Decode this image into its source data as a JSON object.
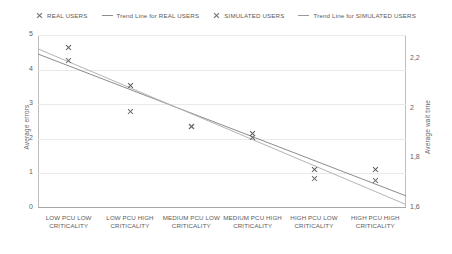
{
  "legend": {
    "items": [
      {
        "label": "REAL USERS",
        "glyph": "x-marker",
        "color": "#555555"
      },
      {
        "label": "Trend Line for REAL USERS",
        "glyph": "line-swatch",
        "color": "#8c8c8c"
      },
      {
        "label": "SIMULATED USERS",
        "glyph": "x-marker",
        "color": "#666666"
      },
      {
        "label": "Trend Line for SIMULATED USERS",
        "glyph": "line-swatch",
        "color": "#b0b0b0"
      }
    ]
  },
  "axes": {
    "left_title": "Average errors",
    "right_title": "Average wait time",
    "left_ticks": [
      "5",
      "4",
      "3",
      "2",
      "1",
      "0"
    ],
    "right_ticks": [
      "2,2",
      "2",
      "1,8",
      "1,6"
    ]
  },
  "chart_data": {
    "type": "scatter",
    "title": "",
    "xlabel": "",
    "ylabel": "Average errors",
    "y2label": "Average wait time",
    "ylim": [
      0,
      5
    ],
    "y2lim": [
      1.6,
      2.2
    ],
    "grid": true,
    "legend_position": "top",
    "categories": [
      "LOW PCU LOW CRITICALITY",
      "LOW PCU HIGH CRITICALITY",
      "MEDIUM PCU LOW CRITICALITY",
      "MEDIUM PCU HIGH CRITICALITY",
      "HIGH PCU LOW CRITICALITY",
      "HIGH PCU HIGH CRITICALITY"
    ],
    "series": [
      {
        "name": "REAL USERS",
        "type": "scatter",
        "axis": "left",
        "values": [
          4.65,
          3.55,
          2.35,
          2.15,
          1.1,
          1.1
        ]
      },
      {
        "name": "SIMULATED USERS",
        "type": "scatter",
        "axis": "right",
        "values": [
          4.25,
          2.8,
          2.35,
          2.05,
          0.85,
          0.8
        ]
      },
      {
        "name": "Trend Line for REAL USERS",
        "type": "line",
        "axis": "left",
        "endpoints": [
          4.45,
          0.35
        ]
      },
      {
        "name": "Trend Line for SIMULATED USERS",
        "type": "line",
        "axis": "right",
        "endpoints": [
          4.6,
          0.1
        ]
      }
    ]
  }
}
